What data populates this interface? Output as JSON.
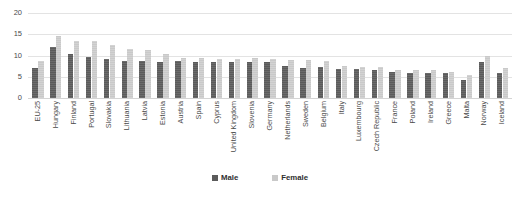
{
  "chart_data": {
    "type": "bar",
    "title": "",
    "xlabel": "",
    "ylabel": "",
    "ylim": [
      0,
      20
    ],
    "yticks": [
      0,
      5,
      10,
      15,
      20
    ],
    "grid": true,
    "legend_position": "bottom",
    "categories": [
      "EU-25",
      "Hungary",
      "Finland",
      "Portugal",
      "Slovakia",
      "Lithuania",
      "Latvia",
      "Estonia",
      "Austria",
      "Spain",
      "Cyprus",
      "United Kingdom",
      "Slovenia",
      "Germany",
      "Netherlands",
      "Sweden",
      "Belgium",
      "Italy",
      "Luxembourg",
      "Czech Republic",
      "France",
      "Poland",
      "Ireland",
      "Greece",
      "Malta",
      "Norway",
      "Iceland"
    ],
    "series": [
      {
        "name": "Male",
        "color": "#5b5b5b",
        "values": [
          7.0,
          12.0,
          10.3,
          9.6,
          9.2,
          8.6,
          8.6,
          8.5,
          8.6,
          8.5,
          8.5,
          8.5,
          8.5,
          8.4,
          7.6,
          7.1,
          7.2,
          6.8,
          6.8,
          6.7,
          6.2,
          6.0,
          5.9,
          5.8,
          4.3,
          8.5,
          5.8
        ]
      },
      {
        "name": "Female",
        "color": "#c9c9c9",
        "values": [
          8.7,
          14.5,
          13.4,
          13.3,
          12.5,
          11.6,
          11.4,
          10.4,
          9.5,
          9.3,
          9.2,
          9.1,
          9.3,
          9.2,
          9.0,
          8.9,
          8.8,
          7.5,
          7.3,
          7.2,
          6.7,
          6.6,
          6.5,
          6.2,
          5.3,
          9.8,
          7.0
        ]
      }
    ]
  },
  "legend": {
    "male_label": "Male",
    "female_label": "Female"
  },
  "axis": {
    "tick_20": "20",
    "tick_15": "15",
    "tick_10": "10",
    "tick_5": "5",
    "tick_0": "0"
  }
}
